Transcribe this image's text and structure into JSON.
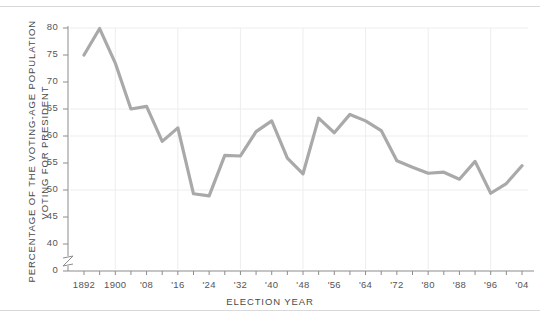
{
  "chart_data": {
    "type": "line",
    "title": "",
    "subtitle": "",
    "xlabel": "ELECTION YEAR",
    "ylabel": "PERCENTAGE OF THE VOTING-AGE POPULATION VOTING FOR PRESIDENT",
    "ylabel_lines": [
      "PERCENTAGE OF THE VOTING-AGE POPULATION",
      "VOTING FOR PRESIDENT"
    ],
    "x": [
      1892,
      1896,
      1900,
      1904,
      1908,
      1912,
      1916,
      1920,
      1924,
      1928,
      1932,
      1936,
      1940,
      1944,
      1948,
      1952,
      1956,
      1960,
      1964,
      1968,
      1972,
      1976,
      1980,
      1984,
      1988,
      1992,
      1996,
      2000,
      2004
    ],
    "values": [
      75.0,
      79.9,
      73.5,
      65.0,
      65.5,
      59.0,
      61.5,
      49.3,
      48.9,
      56.4,
      56.3,
      60.8,
      62.8,
      55.9,
      53.0,
      63.3,
      60.6,
      64.0,
      62.8,
      61.0,
      55.4,
      54.2,
      53.1,
      53.3,
      52.0,
      55.3,
      49.4,
      51.2,
      54.5
    ],
    "xtick_labels": [
      "1892",
      "1900",
      "'08",
      "'16",
      "'24",
      "'32",
      "'40",
      "'48",
      "'56",
      "'64",
      "'72",
      "'80",
      "'88",
      "'96",
      "'04"
    ],
    "xtick_values": [
      1892,
      1900,
      1908,
      1916,
      1924,
      1932,
      1940,
      1948,
      1956,
      1964,
      1972,
      1980,
      1988,
      1996,
      2004
    ],
    "ytick_labels": [
      "0",
      "40",
      "45",
      "50",
      "55",
      "60",
      "65",
      "70",
      "75",
      "80"
    ],
    "ytick_values": [
      0,
      40,
      45,
      50,
      55,
      60,
      65,
      70,
      75,
      80
    ],
    "ylim": [
      38,
      81
    ],
    "xlim": [
      1890,
      2006
    ],
    "axis_break": true,
    "grid": true,
    "grid_y_values": [
      50,
      60,
      65,
      80
    ],
    "grid_x_values": [
      1900,
      1916,
      1932,
      1948,
      1964,
      1980,
      1996
    ],
    "legend": null,
    "line_color": "#a9a9a9",
    "grid_color": "#ededed",
    "axis_color": "#8c8c8c",
    "text_color": "#555555",
    "background_color": "#ffffff"
  }
}
